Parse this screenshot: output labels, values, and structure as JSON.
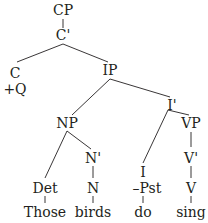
{
  "tree": {
    "nodes": [
      {
        "id": "cp",
        "label": "CP",
        "x": 63,
        "y": 15
      },
      {
        "id": "cbar",
        "label": "C'",
        "x": 63,
        "y": 40
      },
      {
        "id": "c",
        "label": "C",
        "x": 15,
        "y": 78
      },
      {
        "id": "plusq",
        "label": "+Q",
        "x": 15,
        "y": 94
      },
      {
        "id": "ip",
        "label": "IP",
        "x": 110,
        "y": 75
      },
      {
        "id": "ibar",
        "label": "I'",
        "x": 172,
        "y": 110
      },
      {
        "id": "np",
        "label": "NP",
        "x": 67,
        "y": 128
      },
      {
        "id": "vp",
        "label": "VP",
        "x": 191,
        "y": 128
      },
      {
        "id": "nbar",
        "label": "N'",
        "x": 93,
        "y": 163
      },
      {
        "id": "vbar",
        "label": "V'",
        "x": 191,
        "y": 163
      },
      {
        "id": "i",
        "label": "I",
        "x": 143,
        "y": 177
      },
      {
        "id": "pst",
        "label": "–Pst",
        "x": 147,
        "y": 193
      },
      {
        "id": "det",
        "label": "Det",
        "x": 45,
        "y": 193
      },
      {
        "id": "n",
        "label": "N",
        "x": 93,
        "y": 193
      },
      {
        "id": "v",
        "label": "V",
        "x": 191,
        "y": 193
      },
      {
        "id": "those",
        "label": "Those",
        "x": 45,
        "y": 217
      },
      {
        "id": "birds",
        "label": "birds",
        "x": 93,
        "y": 217
      },
      {
        "id": "do",
        "label": "do",
        "x": 143,
        "y": 217
      },
      {
        "id": "sing",
        "label": "sing",
        "x": 191,
        "y": 217
      }
    ],
    "edges": [
      {
        "from": "cp",
        "to": "cbar",
        "x1": 63,
        "y1": 19,
        "x2": 63,
        "y2": 28
      },
      {
        "from": "cbar",
        "to": "c",
        "x1": 63,
        "y1": 44,
        "x2": 17,
        "y2": 62
      },
      {
        "from": "cbar",
        "to": "ip",
        "x1": 63,
        "y1": 44,
        "x2": 108,
        "y2": 62
      },
      {
        "from": "ip",
        "to": "np",
        "x1": 110,
        "y1": 79,
        "x2": 72,
        "y2": 115
      },
      {
        "from": "ip",
        "to": "ibar",
        "x1": 110,
        "y1": 79,
        "x2": 170,
        "y2": 97
      },
      {
        "from": "ibar",
        "to": "i",
        "x1": 168,
        "y1": 110,
        "x2": 143,
        "y2": 163
      },
      {
        "from": "ibar",
        "to": "vp",
        "x1": 168,
        "y1": 110,
        "x2": 189,
        "y2": 115
      },
      {
        "from": "np",
        "to": "det",
        "x1": 67,
        "y1": 131,
        "x2": 45,
        "y2": 178
      },
      {
        "from": "np",
        "to": "nbar",
        "x1": 67,
        "y1": 131,
        "x2": 91,
        "y2": 149
      },
      {
        "from": "vp",
        "to": "vbar",
        "x1": 191,
        "y1": 132,
        "x2": 191,
        "y2": 147
      },
      {
        "from": "nbar",
        "to": "n",
        "x1": 93,
        "y1": 166,
        "x2": 93,
        "y2": 178
      },
      {
        "from": "vbar",
        "to": "v",
        "x1": 191,
        "y1": 166,
        "x2": 191,
        "y2": 178
      },
      {
        "from": "det",
        "to": "those",
        "x1": 45,
        "y1": 196,
        "x2": 45,
        "y2": 203
      },
      {
        "from": "n",
        "to": "birds",
        "x1": 93,
        "y1": 196,
        "x2": 93,
        "y2": 203
      },
      {
        "from": "pst",
        "to": "do",
        "x1": 143,
        "y1": 196,
        "x2": 143,
        "y2": 203
      },
      {
        "from": "v",
        "to": "sing",
        "x1": 191,
        "y1": 196,
        "x2": 191,
        "y2": 203
      }
    ]
  }
}
